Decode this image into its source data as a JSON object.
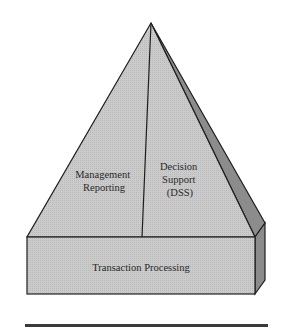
{
  "diagram": {
    "type": "pyramid",
    "colors": {
      "face_fill": "#c6c6c6",
      "side_fill": "#8c8c8c",
      "outline": "#1e1e1e",
      "rule": "#3a3a3a"
    },
    "apex": {
      "x": 151,
      "y": 23
    },
    "sections": [
      {
        "id": "management-reporting",
        "lines": [
          "Management",
          "Reporting"
        ]
      },
      {
        "id": "decision-support",
        "lines": [
          "Decision",
          "Support",
          "(DSS)"
        ]
      }
    ],
    "base": {
      "label": "Transaction Processing"
    }
  }
}
